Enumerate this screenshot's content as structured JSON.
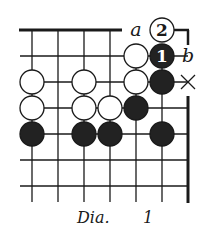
{
  "diagram": {
    "caption_prefix": "Dia.",
    "caption_number": "1",
    "colors": {
      "ink": "#1a1a1a",
      "paper": "#ffffff",
      "black_stone": "#222222",
      "white_stone": "#ffffff"
    },
    "grid": {
      "columns_x": [
        32,
        58,
        84,
        110,
        136,
        162,
        188
      ],
      "rows_y": [
        30,
        56,
        82,
        108,
        134,
        160,
        186
      ],
      "top_edge": true,
      "right_edge": true
    },
    "stones": [
      {
        "color": "white",
        "col": 4,
        "row": 1
      },
      {
        "color": "black",
        "col": 5,
        "row": 1,
        "label": "1"
      },
      {
        "color": "white",
        "col": 0,
        "row": 2
      },
      {
        "color": "white",
        "col": 2,
        "row": 2
      },
      {
        "color": "white",
        "col": 4,
        "row": 2
      },
      {
        "color": "black",
        "col": 5,
        "row": 2
      },
      {
        "color": "white",
        "col": 0,
        "row": 3
      },
      {
        "color": "white",
        "col": 2,
        "row": 3
      },
      {
        "color": "white",
        "col": 3,
        "row": 3
      },
      {
        "color": "black",
        "col": 4,
        "row": 3
      },
      {
        "color": "black",
        "col": 0,
        "row": 4
      },
      {
        "color": "black",
        "col": 2,
        "row": 4
      },
      {
        "color": "black",
        "col": 3,
        "row": 4
      },
      {
        "color": "black",
        "col": 5,
        "row": 4
      },
      {
        "color": "white",
        "col": 5,
        "row": 0,
        "label": "2"
      }
    ],
    "markers": [
      {
        "type": "letter",
        "text": "a",
        "col": 4,
        "row": 0
      },
      {
        "type": "letter",
        "text": "b",
        "col": 6,
        "row": 1
      },
      {
        "type": "cross",
        "text": "×",
        "col": 6,
        "row": 2
      }
    ]
  }
}
